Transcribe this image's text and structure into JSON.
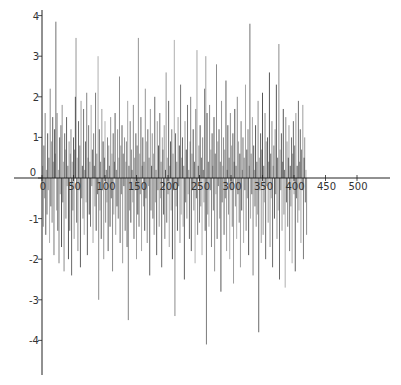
{
  "chart_data": {
    "type": "line",
    "style": "vertical-spikes",
    "title": "",
    "xlabel": "",
    "ylabel": "",
    "xlim": [
      0,
      530
    ],
    "ylim": [
      -4.6,
      4.1
    ],
    "grid": false,
    "legend": "none",
    "x_ticks": [
      0,
      50,
      100,
      150,
      200,
      250,
      300,
      350,
      400,
      450,
      500
    ],
    "x_tick_labels": [
      "0",
      "50",
      "100",
      "150",
      "200",
      "250",
      "300",
      "350",
      "400",
      "450",
      "500"
    ],
    "y_ticks": [
      4,
      3,
      2,
      1,
      0,
      -1,
      -2,
      -3,
      -4
    ],
    "y_tick_labels": [
      "4",
      "3",
      "2",
      "1",
      "0",
      "-1",
      "-2",
      "-3",
      "-4"
    ],
    "colors": {
      "line": "#3a3a3a",
      "axis": "#222222",
      "background": "#ffffff"
    },
    "series": [
      {
        "name": "series",
        "x_start": 1,
        "x_step": 1,
        "values": [
          0.3,
          -1.2,
          0.8,
          -0.5,
          1.6,
          -1.4,
          0.2,
          -0.9,
          1.1,
          -0.3,
          0.5,
          -1.6,
          2.2,
          -0.7,
          0.9,
          -1.1,
          1.5,
          0.4,
          -1.9,
          1.2,
          0.6,
          3.85,
          -0.8,
          1.6,
          -1.3,
          0.2,
          -2.1,
          1.0,
          -0.4,
          1.3,
          -1.7,
          1.8,
          -0.6,
          0.4,
          -2.3,
          1.1,
          0.7,
          -1.0,
          1.5,
          -0.2,
          0.3,
          -2.0,
          0.9,
          -1.3,
          0.6,
          1.2,
          -2.4,
          0.4,
          -0.8,
          1.0,
          -1.5,
          0.7,
          2.0,
          3.45,
          -1.1,
          0.5,
          -1.8,
          1.4,
          -0.3,
          0.8,
          -2.2,
          1.9,
          -0.5,
          0.3,
          -1.0,
          1.7,
          -1.4,
          0.2,
          0.9,
          -0.6,
          2.1,
          -1.9,
          0.5,
          1.3,
          -0.9,
          0.4,
          -1.2,
          1.8,
          -0.2,
          0.7,
          -1.6,
          1.1,
          0.3,
          -0.7,
          2.1,
          -1.3,
          0.6,
          -0.4,
          3.0,
          -3.0,
          1.2,
          -0.8,
          0.4,
          -1.5,
          1.7,
          -0.3,
          0.9,
          -2.0,
          0.5,
          1.4,
          -1.1,
          0.2,
          -0.6,
          1.0,
          -1.8,
          0.8,
          0.3,
          -1.2,
          1.5,
          -0.5,
          0.6,
          -2.3,
          1.1,
          -0.9,
          0.4,
          1.6,
          -1.4,
          0.2,
          -0.7,
          1.2,
          -1.0,
          0.5,
          2.5,
          -1.6,
          0.8,
          -0.4,
          1.3,
          -2.1,
          0.6,
          -0.2,
          1.0,
          -1.3,
          0.4,
          0.9,
          -1.7,
          1.9,
          -3.5,
          0.3,
          -0.8,
          1.4,
          -1.1,
          0.7,
          0.2,
          -0.6,
          1.8,
          -1.5,
          0.5,
          -0.3,
          1.1,
          -2.0,
          0.8,
          -0.9,
          3.45,
          -1.2,
          0.6,
          -0.4,
          1.5,
          -1.8,
          0.3,
          1.0,
          -0.7,
          0.4,
          -1.3,
          2.2,
          -0.5,
          0.9,
          -1.6,
          1.2,
          -0.2,
          0.5,
          -2.4,
          1.7,
          -0.8,
          0.3,
          1.1,
          -1.0,
          0.6,
          -1.4,
          2.0,
          -0.6,
          0.2,
          -1.9,
          1.4,
          -0.3,
          0.8,
          -1.2,
          1.6,
          -0.5,
          0.4,
          -2.2,
          1.0,
          0.7,
          -0.9,
          1.3,
          -1.5,
          0.2,
          2.6,
          -1.1,
          0.5,
          -0.4,
          1.9,
          -1.7,
          0.3,
          0.9,
          -0.8,
          1.2,
          -2.0,
          0.6,
          -0.3,
          3.4,
          -3.4,
          1.1,
          -0.7,
          0.4,
          -1.3,
          1.5,
          -0.2,
          0.8,
          -1.6,
          2.3,
          -0.9,
          0.5,
          1.0,
          -1.2,
          0.3,
          -2.5,
          1.4,
          -0.6,
          0.7,
          -1.0,
          1.8,
          -0.4,
          0.2,
          -1.5,
          0.9,
          2.0,
          -1.8,
          0.6,
          -0.3,
          1.2,
          -0.8,
          0.4,
          -2.1,
          1.7,
          -0.5,
          3.15,
          -1.4,
          0.3,
          0.8,
          -1.1,
          1.3,
          -0.7,
          0.5,
          -1.9,
          1.0,
          0.2,
          -0.6,
          2.2,
          -1.3,
          3.0,
          -4.1,
          1.6,
          -0.9,
          0.4,
          -1.2,
          1.8,
          -0.3,
          0.7,
          -1.7,
          1.1,
          0.3,
          -0.8,
          1.5,
          -2.3,
          0.6,
          -0.4,
          2.8,
          -1.5,
          0.9,
          -0.2,
          1.2,
          -1.0,
          0.4,
          -2.8,
          1.9,
          -0.6,
          0.3,
          1.0,
          -1.4,
          0.7,
          -0.5,
          2.4,
          -1.8,
          0.2,
          1.3,
          -0.9,
          0.5,
          -2.0,
          1.6,
          -0.3,
          0.8,
          -1.2,
          1.1,
          -2.6,
          0.4,
          1.7,
          -0.7,
          0.3,
          -1.5,
          2.0,
          -0.4,
          0.9,
          -1.1,
          0.6,
          -2.2,
          1.4,
          -0.8,
          0.2,
          1.0,
          -1.6,
          0.5,
          -0.3,
          2.3,
          -1.3,
          0.7,
          -0.5,
          1.2,
          -1.9,
          0.3,
          3.8,
          -1.0,
          0.6,
          -0.4,
          1.5,
          -2.4,
          0.8,
          0.2,
          -0.7,
          1.3,
          -1.2,
          0.4,
          -0.9,
          1.9,
          -3.8,
          0.5,
          -0.3,
          1.1,
          -1.6,
          0.7,
          2.1,
          -1.4,
          0.3,
          -0.6,
          1.6,
          -2.0,
          0.9,
          -0.2,
          1.0,
          -1.1,
          0.4,
          2.6,
          -1.7,
          0.6,
          -0.5,
          1.4,
          -2.2,
          0.3,
          0.8,
          -1.0,
          1.2,
          -0.4,
          2.3,
          -1.5,
          0.5,
          -0.8,
          3.3,
          -2.5,
          0.7,
          -0.3,
          1.1,
          -1.3,
          0.4,
          1.7,
          -0.9,
          0.2,
          -2.7,
          1.5,
          -0.6,
          0.9,
          -1.2,
          0.5,
          1.3,
          -1.8,
          0.3,
          -0.7,
          1.0,
          -2.1,
          0.6,
          1.4,
          -0.4,
          0.8,
          -2.3,
          1.6,
          -0.5,
          0.3,
          -1.1,
          1.9,
          -0.8,
          0.4,
          1.2,
          -1.6,
          0.7,
          -0.3,
          1.8,
          -2.0,
          0.5,
          1.0,
          -0.6,
          0.2,
          -1.4
        ]
      }
    ]
  }
}
